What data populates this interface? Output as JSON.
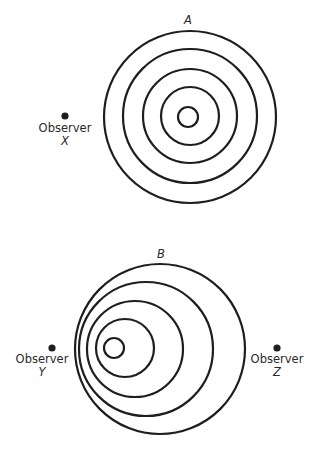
{
  "diagrams": {
    "A": {
      "label": "A",
      "label_pos": [
        188,
        24
      ],
      "rings": [
        {
          "cx": 190,
          "cy": 117,
          "r": 86
        },
        {
          "cx": 190,
          "cy": 116,
          "r": 67
        },
        {
          "cx": 190,
          "cy": 116,
          "r": 47
        },
        {
          "cx": 190,
          "cy": 116,
          "r": 29
        },
        {
          "cx": 188,
          "cy": 117,
          "r": 10
        }
      ]
    },
    "B": {
      "label": "B",
      "label_pos": [
        161,
        258
      ],
      "rings": [
        {
          "cx": 160,
          "cy": 349,
          "r": 85
        },
        {
          "cx": 146,
          "cy": 349,
          "r": 67
        },
        {
          "cx": 135,
          "cy": 349,
          "r": 48
        },
        {
          "cx": 125,
          "cy": 348,
          "r": 29
        },
        {
          "cx": 114,
          "cy": 348,
          "r": 10
        }
      ]
    }
  },
  "observers": [
    {
      "id": "X",
      "word": "Observer",
      "letter": "X",
      "dot": [
        65,
        116
      ],
      "text_y": 132,
      "letter_y": 145
    },
    {
      "id": "Y",
      "word": "Observer",
      "letter": "Y",
      "dot": [
        52,
        348
      ],
      "text_y": 363,
      "letter_y": 376
    },
    {
      "id": "Z",
      "word": "Observer",
      "letter": "Z",
      "dot": [
        277,
        348
      ],
      "text_y": 363,
      "letter_y": 376
    }
  ],
  "colors": {
    "stroke": "#1e1e1e",
    "text": "#2a2a2a",
    "background": "#ffffff"
  }
}
